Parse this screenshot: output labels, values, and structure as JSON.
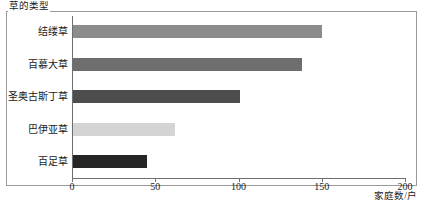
{
  "chart_data": {
    "type": "bar",
    "orientation": "horizontal",
    "title": "",
    "xlabel": "家庭数/户",
    "ylabel": "草的类型",
    "categories": [
      "结缕草",
      "百慕大草",
      "圣奥古斯丁草",
      "巴伊亚草",
      "百足草"
    ],
    "values": [
      150,
      138,
      101,
      62,
      45
    ],
    "xlim": [
      0,
      200
    ],
    "xticks": [
      0,
      50,
      100,
      150,
      200
    ],
    "xtick_labels": [
      "0",
      "50",
      "100",
      "150",
      "200"
    ],
    "grid": false,
    "legend": false,
    "bar_colors": [
      "#8c8c8c",
      "#6e6e6e",
      "#4d4d4d",
      "#d4d4d4",
      "#262626"
    ],
    "frame_color": "#9a9a9a",
    "axis_color": "#6f6f6f"
  }
}
